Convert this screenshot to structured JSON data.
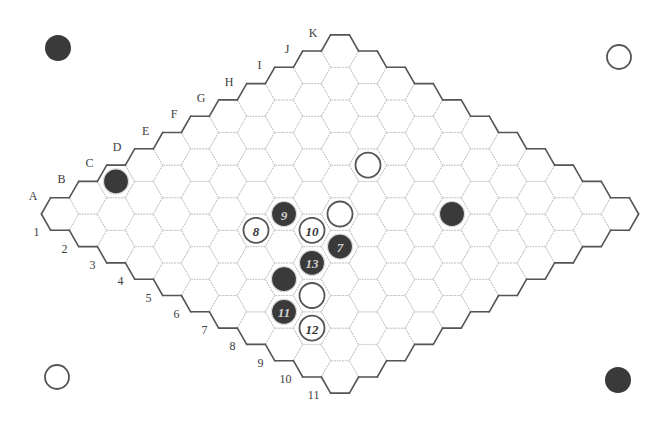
{
  "board": {
    "size": 11,
    "geometry": {
      "x0": 60,
      "y0": 214,
      "dx": 28.0,
      "dy": 16.3,
      "side": 18.6
    },
    "column_labels": [
      "A",
      "B",
      "C",
      "D",
      "E",
      "F",
      "G",
      "H",
      "I",
      "J",
      "K"
    ],
    "row_labels": [
      "1",
      "2",
      "3",
      "4",
      "5",
      "6",
      "7",
      "8",
      "9",
      "10",
      "11"
    ],
    "colors": {
      "black_stone": "#3a3a3a",
      "white_stone_border": "#555555",
      "grid": "#bdbdbd",
      "edge": "#555555"
    }
  },
  "corner_markers": [
    {
      "position": "top-left",
      "color": "black",
      "x": 58,
      "y": 48,
      "r": 13
    },
    {
      "position": "top-right",
      "color": "white",
      "x": 619,
      "y": 57,
      "r": 12
    },
    {
      "position": "bottom-left",
      "color": "white",
      "x": 57,
      "y": 377,
      "r": 12
    },
    {
      "position": "bottom-right",
      "color": "black",
      "x": 618,
      "y": 380,
      "r": 13
    }
  ],
  "stones": [
    {
      "cell": "C1",
      "col": 2,
      "row": 0,
      "color": "black",
      "label": ""
    },
    {
      "cell": "H5",
      "col": 7,
      "row": 4,
      "color": "white",
      "label": ""
    },
    {
      "cell": "H8",
      "col": 7,
      "row": 7,
      "color": "black",
      "label": ""
    },
    {
      "cell": "F6",
      "col": 5,
      "row": 5,
      "color": "white",
      "label": ""
    },
    {
      "cell": "E7",
      "col": 4,
      "row": 6,
      "color": "black",
      "label": "7"
    },
    {
      "cell": "D5",
      "col": 3,
      "row": 4,
      "color": "white",
      "label": "8"
    },
    {
      "cell": "E5",
      "col": 4,
      "row": 4,
      "color": "black",
      "label": "9"
    },
    {
      "cell": "E6",
      "col": 4,
      "row": 5,
      "color": "white",
      "label": "10"
    },
    {
      "cell": "B8",
      "col": 1,
      "row": 7,
      "color": "black",
      "label": "11"
    },
    {
      "cell": "B9",
      "col": 1,
      "row": 8,
      "color": "white",
      "label": "12"
    },
    {
      "cell": "D7",
      "col": 3,
      "row": 6,
      "color": "black",
      "label": "13"
    },
    {
      "cell": "C7",
      "col": 2,
      "row": 6,
      "color": "black",
      "label": ""
    },
    {
      "cell": "C8",
      "col": 2,
      "row": 7,
      "color": "white",
      "label": ""
    }
  ]
}
